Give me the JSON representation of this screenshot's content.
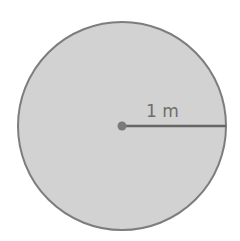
{
  "diagram": {
    "shape": "circle",
    "fill_color": "#d3d3d3",
    "stroke_color": "#7a7a7a",
    "radius_label": "1 m",
    "center_point": "center-dot",
    "radius_line": "horizontal to right edge"
  }
}
